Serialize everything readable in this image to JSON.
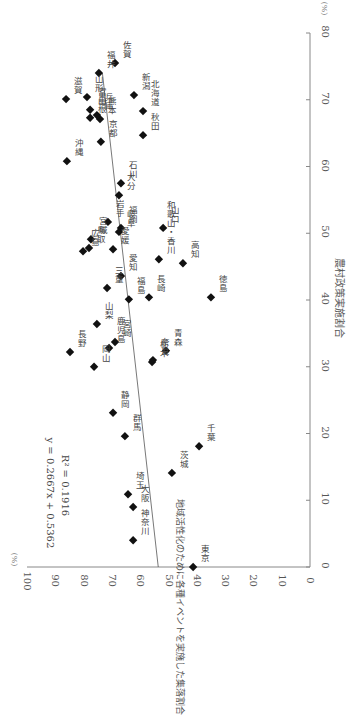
{
  "chart_data": {
    "type": "scatter",
    "orientation": "rotated 90° clockwise",
    "title": "",
    "xlabel": "農村政策実施割合",
    "ylabel": "地域活性化のために各種イベントを実施した集落割合",
    "x_unit": "(%)",
    "y_unit": "(%)",
    "xlim": [
      0,
      80
    ],
    "ylim": [
      0,
      100
    ],
    "x_ticks": [
      "0",
      "10",
      "20",
      "30",
      "40",
      "50",
      "60",
      "70",
      "80"
    ],
    "y_ticks": [
      "0",
      "10",
      "20",
      "30",
      "40",
      "50",
      "60",
      "70",
      "80",
      "90",
      "100"
    ],
    "grid": false,
    "legend": null,
    "trendline": {
      "equation": "y = 0.2667x + 0.5362",
      "r_squared": "R² = 0.1916",
      "slope": 0.2667,
      "intercept": 53.62
    },
    "points": [
      {
        "label": "佐賀",
        "x": 75.5,
        "y": 68.9
      },
      {
        "label": "福井",
        "x": 74.0,
        "y": 74.6
      },
      {
        "label": "滋賀",
        "x": 70.1,
        "y": 86.2
      },
      {
        "label": "山形",
        "x": 70.4,
        "y": 78.8
      },
      {
        "label": "新潟",
        "x": 70.7,
        "y": 62.2
      },
      {
        "label": "富山",
        "x": 68.5,
        "y": 77.7
      },
      {
        "label": "兵庫",
        "x": 67.7,
        "y": 75.3
      },
      {
        "label": "島根",
        "x": 67.3,
        "y": 77.7
      },
      {
        "label": "熊本",
        "x": 67.1,
        "y": 74.2
      },
      {
        "label": "北海道",
        "x": 68.3,
        "y": 59.0
      },
      {
        "label": "京都",
        "x": 63.7,
        "y": 73.9
      },
      {
        "label": "秋田",
        "x": 64.7,
        "y": 59.0
      },
      {
        "label": "沖縄",
        "x": 60.8,
        "y": 85.9
      },
      {
        "label": "石川",
        "x": 57.5,
        "y": 66.8
      },
      {
        "label": "大分",
        "x": 55.7,
        "y": 67.5
      },
      {
        "label": "岩手",
        "x": 51.7,
        "y": 71.4
      },
      {
        "label": "福岡",
        "x": 50.8,
        "y": 66.8
      },
      {
        "label": "岐阜",
        "x": 50.2,
        "y": 67.5
      },
      {
        "label": "山口",
        "x": 50.8,
        "y": 51.9
      },
      {
        "label": "宮城",
        "x": 49.1,
        "y": 77.4
      },
      {
        "label": "鳥取",
        "x": 47.8,
        "y": 78.1
      },
      {
        "label": "広島",
        "x": 47.3,
        "y": 80.2
      },
      {
        "label": "愛媛",
        "x": 47.6,
        "y": 69.6
      },
      {
        "label": "愛知",
        "x": 43.6,
        "y": 66.8
      },
      {
        "label": "三重",
        "x": 41.8,
        "y": 71.7
      },
      {
        "label": "和歌山・香川",
        "x": 46.1,
        "y": 53.4
      },
      {
        "label": "高知",
        "x": 45.5,
        "y": 44.9
      },
      {
        "label": "福島",
        "x": 40.1,
        "y": 64.0
      },
      {
        "label": "長崎",
        "x": 40.4,
        "y": 56.9
      },
      {
        "label": "徳島",
        "x": 40.4,
        "y": 35.0
      },
      {
        "label": "山梨",
        "x": 36.4,
        "y": 75.3
      },
      {
        "label": "長野",
        "x": 32.2,
        "y": 84.8
      },
      {
        "label": "宮崎",
        "x": 33.7,
        "y": 68.9
      },
      {
        "label": "鹿児島",
        "x": 32.8,
        "y": 71.0
      },
      {
        "label": "岡山",
        "x": 30.0,
        "y": 76.3
      },
      {
        "label": "奈良",
        "x": 31.0,
        "y": 55.5
      },
      {
        "label": "栃木",
        "x": 30.7,
        "y": 55.8
      },
      {
        "label": "青森",
        "x": 32.4,
        "y": 50.9
      },
      {
        "label": "静岡",
        "x": 23.1,
        "y": 69.6
      },
      {
        "label": "群馬",
        "x": 19.6,
        "y": 65.4
      },
      {
        "label": "千葉",
        "x": 18.1,
        "y": 39.2
      },
      {
        "label": "茨城",
        "x": 14.1,
        "y": 48.8
      },
      {
        "label": "埼玉",
        "x": 10.9,
        "y": 64.3
      },
      {
        "label": "大阪",
        "x": 9.0,
        "y": 62.5
      },
      {
        "label": "神奈川",
        "x": 4.0,
        "y": 62.5
      },
      {
        "label": "東京",
        "x": 0.0,
        "y": 41.3
      }
    ]
  },
  "colors": {
    "marker": "#111111",
    "axis": "#888888",
    "trendline": "#555555",
    "text": "#444444"
  }
}
